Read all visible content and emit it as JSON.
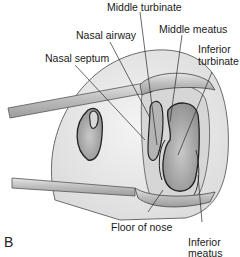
{
  "figure": {
    "panel_letter": "B",
    "labels": {
      "middle_turbinate": "Middle turbinate",
      "nasal_airway": "Nasal airway",
      "middle_meatus": "Middle meatus",
      "nasal_septum": "Nasal septum",
      "inferior_turbinate_1": "Inferior",
      "inferior_turbinate_2": "turbinate",
      "floor_of_nose": "Floor of nose",
      "inferior_meatus_1": "Inferior",
      "inferior_meatus_2": "meatus"
    },
    "colors": {
      "outline": "#3a3a3a",
      "skin_fill": "#ececec",
      "cavity_fill": "#bdbdbd",
      "instrument_fill": "#cfcfcf",
      "leader_line": "#2a2a2a"
    }
  }
}
